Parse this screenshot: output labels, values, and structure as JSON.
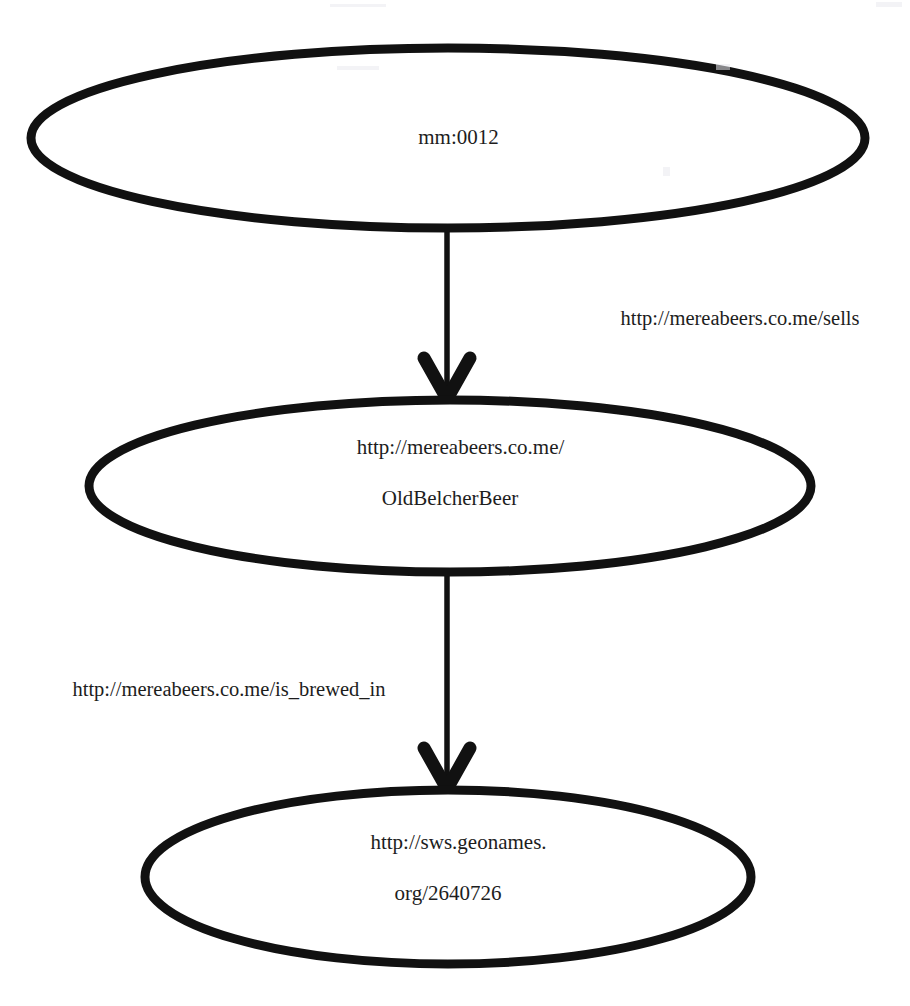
{
  "diagram": {
    "type": "directed-graph",
    "background_color": "#ffffff",
    "stroke_color": "#111111",
    "text_color": "#1d1d1d",
    "nodes": [
      {
        "id": "node-mm-0012",
        "name": "mm:0012",
        "label_line1": "mm:0012",
        "label_line2": "",
        "cx": 448,
        "cy": 138,
        "rx": 418,
        "ry": 90
      },
      {
        "id": "node-oldbelcherbeer",
        "name": "http://mereabeers.co.me/OldBelcherBeer",
        "label_line1": "http://mereabeers.co.me/",
        "label_line2": "OldBelcherBeer",
        "cx": 450,
        "cy": 486,
        "rx": 362,
        "ry": 87
      },
      {
        "id": "node-geonames-2640726",
        "name": "http://sws.geonames.org/2640726",
        "label_line1": "http://sws.geonames.",
        "label_line2": "org/2640726",
        "cx": 448,
        "cy": 877,
        "rx": 304,
        "ry": 87
      }
    ],
    "edges": [
      {
        "id": "edge-sells",
        "label": "http://mereabeers.co.me/sells",
        "from": "node-mm-0012",
        "to": "node-oldbelcherbeer",
        "label_x": 740,
        "label_y": 318,
        "arrowhead": "chevron"
      },
      {
        "id": "edge-is-brewed-in",
        "label": "http://mereabeers.co.me/is_brewed_in",
        "from": "node-oldbelcherbeer",
        "to": "node-geonames-2640726",
        "label_x": 229,
        "label_y": 689,
        "arrowhead": "chevron"
      }
    ]
  }
}
